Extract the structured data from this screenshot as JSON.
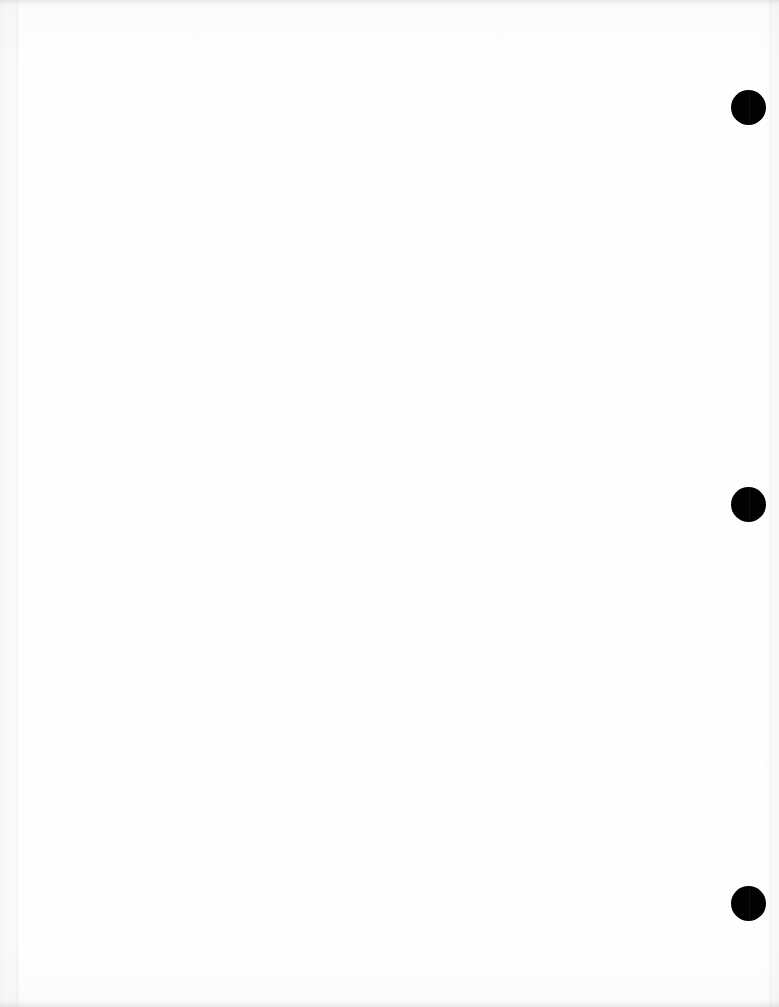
{
  "document": {
    "title": "Scanned Blank Page",
    "page_body_text": "",
    "background_color": "#fdfdfd",
    "page_width": 779,
    "page_height": 1007
  },
  "marks": {
    "color": "#020202",
    "description": "black circular binding / hole-punch marks along right edge",
    "items": [
      {
        "name": "punch-mark-top",
        "x": 731,
        "y": 90,
        "diameter": 35
      },
      {
        "name": "punch-mark-middle",
        "x": 731,
        "y": 487,
        "diameter": 35
      },
      {
        "name": "punch-mark-bottom",
        "x": 731,
        "y": 886,
        "diameter": 35
      }
    ]
  },
  "scan_edges": {
    "top_band_color": "#f0f0f0",
    "bottom_band_color": "#f1f1f1",
    "left_rule_color": "#f4f4f4",
    "right_rule_color": "#f3f3f3"
  }
}
